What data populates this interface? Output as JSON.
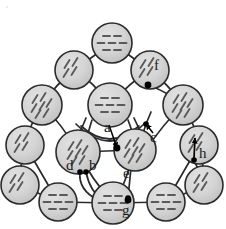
{
  "figure": {
    "kind": "molecular-cluster-diagram",
    "colors": {
      "sphere_fill": "#d2d2d2",
      "sphere_stroke": "#2b2b2b",
      "hatch": "#5a5a5a",
      "bond": "#2b2b2b",
      "marker": "#000000",
      "label": "#1a1a1a",
      "background": "#ffffff"
    },
    "geometry": {
      "sphere_radius_outer": 19,
      "sphere_radius_inner": 20,
      "stroke_width": 1.6
    }
  },
  "spheres": [
    {
      "id": "t1",
      "cx": 112,
      "cy": 43,
      "r": 20,
      "hatch": "h",
      "ring": "outer"
    },
    {
      "id": "t2",
      "cx": 74,
      "cy": 70,
      "r": 19,
      "hatch": "d",
      "ring": "outer"
    },
    {
      "id": "t3",
      "cx": 150,
      "cy": 70,
      "r": 19,
      "hatch": "d",
      "ring": "outer"
    },
    {
      "id": "l1",
      "cx": 42,
      "cy": 105,
      "r": 20,
      "hatch": "d",
      "ring": "outer"
    },
    {
      "id": "r1",
      "cx": 183,
      "cy": 105,
      "r": 20,
      "hatch": "d",
      "ring": "outer"
    },
    {
      "id": "l2",
      "cx": 25,
      "cy": 145,
      "r": 19,
      "hatch": "d",
      "ring": "outer"
    },
    {
      "id": "r2",
      "cx": 199,
      "cy": 145,
      "r": 19,
      "hatch": "d",
      "ring": "outer"
    },
    {
      "id": "l3",
      "cx": 20,
      "cy": 185,
      "r": 19,
      "hatch": "d",
      "ring": "outer"
    },
    {
      "id": "r3",
      "cx": 204,
      "cy": 185,
      "r": 19,
      "hatch": "d",
      "ring": "outer"
    },
    {
      "id": "b1",
      "cx": 58,
      "cy": 202,
      "r": 19,
      "hatch": "h",
      "ring": "outer"
    },
    {
      "id": "b2",
      "cx": 113,
      "cy": 203,
      "r": 21,
      "hatch": "h",
      "ring": "outer"
    },
    {
      "id": "b3",
      "cx": 166,
      "cy": 202,
      "r": 19,
      "hatch": "h",
      "ring": "outer"
    },
    {
      "id": "c-top",
      "cx": 110,
      "cy": 105,
      "r": 22,
      "hatch": "h",
      "ring": "inner"
    },
    {
      "id": "c-left",
      "cx": 78,
      "cy": 152,
      "r": 22,
      "hatch": "d",
      "ring": "inner"
    },
    {
      "id": "c-right",
      "cx": 135,
      "cy": 150,
      "r": 21,
      "hatch": "d",
      "ring": "inner"
    }
  ],
  "labels": [
    {
      "id": "a",
      "text": "a",
      "x": 107,
      "y": 129,
      "marker": {
        "x": 117,
        "y": 148
      },
      "marker_type": "dot",
      "leader": "arrow"
    },
    {
      "id": "b",
      "text": "b",
      "x": 92,
      "y": 166,
      "marker": {
        "x": 86,
        "y": 172
      },
      "marker_type": "dot",
      "leader": "none"
    },
    {
      "id": "c",
      "text": "c",
      "x": 152,
      "y": 137,
      "marker": {
        "x": 146,
        "y": 124
      },
      "marker_type": "dot",
      "leader": "arrow"
    },
    {
      "id": "d",
      "text": "d",
      "x": 70,
      "y": 166,
      "marker": {
        "x": 80,
        "y": 172
      },
      "marker_type": "dot",
      "leader": "none"
    },
    {
      "id": "e",
      "text": "e",
      "x": 126,
      "y": 175,
      "marker": {
        "x": 128,
        "y": 198
      },
      "marker_type": "dot",
      "leader": "none"
    },
    {
      "id": "f",
      "text": "f",
      "x": 156,
      "y": 65,
      "marker": {
        "x": 148,
        "y": 85
      },
      "marker_type": "dot",
      "leader": "none"
    },
    {
      "id": "g",
      "text": "g",
      "x": 124,
      "y": 209,
      "marker": {
        "x": 128,
        "y": 200
      },
      "marker_type": "dot",
      "leader": "none"
    },
    {
      "id": "h",
      "text": "h",
      "x": 200,
      "y": 152,
      "marker": {
        "x": 194,
        "y": 160
      },
      "marker_type": "dot",
      "leader": "arrow-up"
    }
  ],
  "label_list": [
    "a",
    "b",
    "c",
    "d",
    "e",
    "f",
    "g",
    "h"
  ]
}
